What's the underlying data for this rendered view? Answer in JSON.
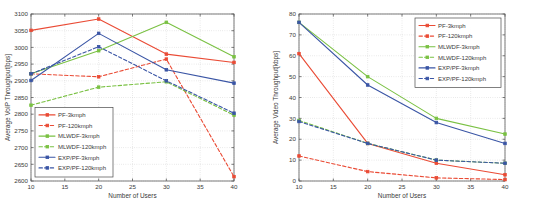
{
  "figure": {
    "panel_count": 2,
    "background": "#ffffff",
    "caption_left": "",
    "caption_right": ""
  },
  "colors": {
    "pf": "#ea4b35",
    "mlwdf": "#7ac143",
    "exppf": "#3a55a5",
    "axis": "#5a5a5a",
    "grid": "#b9b9b9",
    "text": "#3a3a3a"
  },
  "chart_data": [
    {
      "id": "voip-panel",
      "type": "line",
      "title": "",
      "xlabel": "Number of Users",
      "ylabel": "Average VoIP Throughput[bps]",
      "x": [
        10,
        20,
        30,
        40
      ],
      "xlim": [
        10,
        40
      ],
      "ylim": [
        2600,
        3100
      ],
      "xticks": [
        10,
        15,
        20,
        25,
        30,
        35,
        40
      ],
      "yticks": [
        2600,
        2650,
        2700,
        2750,
        2800,
        2850,
        2900,
        2950,
        3000,
        3050,
        3100
      ],
      "grid": true,
      "legend_position": "lower-left",
      "series": [
        {
          "name": "PF-3kmph",
          "color": "#ea4b35",
          "dash": false,
          "values": [
            3051,
            3085,
            2980,
            2955
          ]
        },
        {
          "name": "PF-120kmph",
          "color": "#ea4b35",
          "dash": true,
          "values": [
            2921,
            2912,
            2965,
            2613
          ]
        },
        {
          "name": "MLWDF-3kmph",
          "color": "#7ac143",
          "dash": false,
          "values": [
            2921,
            2990,
            3075,
            2972
          ]
        },
        {
          "name": "MLWDF-120kmph",
          "color": "#7ac143",
          "dash": true,
          "values": [
            2827,
            2881,
            2897,
            2797
          ]
        },
        {
          "name": "EXP/PF-3kmph",
          "color": "#3a55a5",
          "dash": false,
          "values": [
            2901,
            3042,
            2933,
            2893
          ]
        },
        {
          "name": "EXP/PF-120kmph",
          "color": "#3a55a5",
          "dash": true,
          "values": [
            2921,
            3002,
            2900,
            2803
          ]
        }
      ]
    },
    {
      "id": "video-panel",
      "type": "line",
      "title": "",
      "xlabel": "Number of Users",
      "ylabel": "Average Video Throughput[kbps]",
      "x": [
        10,
        20,
        30,
        40
      ],
      "xlim": [
        10,
        40
      ],
      "ylim": [
        0,
        80
      ],
      "xticks": [
        10,
        15,
        20,
        25,
        30,
        35,
        40
      ],
      "yticks": [
        0,
        10,
        20,
        30,
        40,
        50,
        60,
        70,
        80
      ],
      "grid": true,
      "legend_position": "upper-right",
      "series": [
        {
          "name": "PF-3kmph",
          "color": "#ea4b35",
          "dash": false,
          "values": [
            61,
            18,
            8.5,
            3
          ]
        },
        {
          "name": "PF-120kmph",
          "color": "#ea4b35",
          "dash": true,
          "values": [
            12,
            4.5,
            1.5,
            0.7
          ]
        },
        {
          "name": "MLWDF-3kmph",
          "color": "#7ac143",
          "dash": false,
          "values": [
            76,
            50,
            30,
            22.5
          ]
        },
        {
          "name": "MLWDF-120kmph",
          "color": "#7ac143",
          "dash": true,
          "values": [
            29,
            18,
            10,
            8.5
          ]
        },
        {
          "name": "EXP/PF-3kmph",
          "color": "#3a55a5",
          "dash": false,
          "values": [
            76,
            46,
            28,
            18
          ]
        },
        {
          "name": "EXP/PF-120kmph",
          "color": "#3a55a5",
          "dash": true,
          "values": [
            28.5,
            18,
            10,
            8.5
          ]
        }
      ]
    }
  ]
}
